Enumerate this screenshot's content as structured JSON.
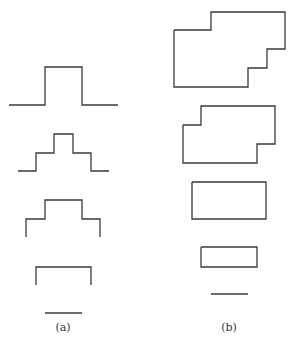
{
  "figure": {
    "panels": [
      {
        "id": "a",
        "label": "(a)",
        "label_pos": [
          63,
          331
        ],
        "shapes": [
          {
            "name": "step-pulse-1",
            "points": "9,105 45,105 45,67 82,67 82,105 118,105"
          },
          {
            "name": "step-pulse-2",
            "points": "18,171 36,171 36,153 54,153 54,134 73,134 73,153 91,153 91,171 109,171"
          },
          {
            "name": "step-pulse-3",
            "points": "26,237 26,219 45,219 45,200 82,200 82,219 100,219 100,237"
          },
          {
            "name": "step-pulse-4",
            "points": "36,285 36,267 91,267 91,285"
          },
          {
            "name": "step-pulse-5",
            "points": "45,313 82,313"
          }
        ]
      },
      {
        "id": "b",
        "label": "(b)",
        "label_pos": [
          229,
          331
        ],
        "shapes": [
          {
            "name": "polygon-1",
            "points": "174,30 211,30 211,12 285,12 285,49 267,49 267,68 248,68 248,87 174,87 174,30"
          },
          {
            "name": "polygon-2",
            "points": "183,125 201,125 201,106 275,106 275,144 257,144 257,163 183,163 183,125"
          },
          {
            "name": "polygon-3",
            "points": "192,182 266,182 266,219 192,219 192,182"
          },
          {
            "name": "polygon-4",
            "points": "201,247 257,247 257,267 201,267 201,247"
          },
          {
            "name": "polygon-5",
            "points": "211,294 248,294"
          }
        ]
      }
    ],
    "stroke_color": "#3a3a3a"
  }
}
